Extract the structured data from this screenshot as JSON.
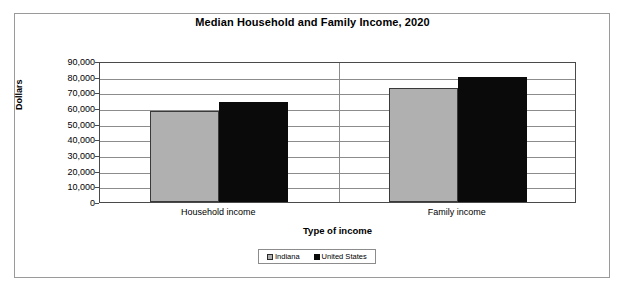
{
  "chart_data": {
    "type": "bar",
    "title": "Median Household and Family Income, 2020",
    "xlabel": "Type of income",
    "ylabel": "Dollars",
    "categories": [
      "Household income",
      "Family income"
    ],
    "series": [
      {
        "name": "Indiana",
        "color": "#b0b0b0",
        "values": [
          58000,
          73000
        ]
      },
      {
        "name": "United States",
        "color": "#0a0a0a",
        "values": [
          64000,
          80000
        ]
      }
    ],
    "ylim": [
      0,
      90000
    ],
    "ytick_values": [
      0,
      10000,
      20000,
      30000,
      40000,
      50000,
      60000,
      70000,
      80000,
      90000
    ],
    "ytick_labels": [
      "0",
      "10,000",
      "20,000",
      "30,000",
      "40,000",
      "50,000",
      "60,000",
      "70,000",
      "80,000",
      "90,000"
    ],
    "grid": true,
    "legend_position": "bottom"
  },
  "legend": {
    "items": [
      {
        "label": "Indiana"
      },
      {
        "label": "United States"
      }
    ]
  }
}
